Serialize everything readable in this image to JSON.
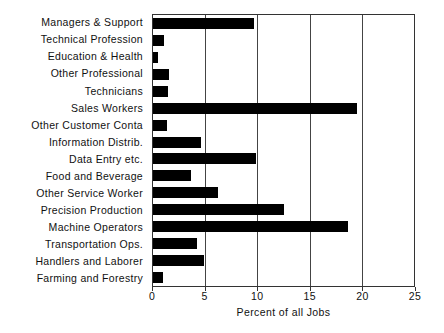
{
  "chart_data": {
    "type": "bar",
    "orientation": "horizontal",
    "title": "",
    "xlabel": "Percent of all Jobs",
    "ylabel": "",
    "xlim": [
      0,
      25
    ],
    "xticks": [
      0,
      5,
      10,
      15,
      20,
      25
    ],
    "grid": true,
    "legend": null,
    "bar_color": "#000000",
    "frame_color": "#333333",
    "categories": [
      "Managers & Support",
      "Technical Profession",
      "Education & Health",
      "Other Professional",
      "Technicians",
      "Sales Workers",
      "Other Customer Conta",
      "Information Distrib.",
      "Data Entry etc.",
      "Food and Beverage",
      "Other Service Worker",
      "Precision Production",
      "Machine Operators",
      "Transportation Ops.",
      "Handlers and Laborer",
      "Farming and Forestry"
    ],
    "values": [
      9.7,
      1.1,
      0.5,
      1.5,
      1.4,
      19.5,
      1.3,
      4.6,
      9.9,
      3.6,
      6.2,
      12.5,
      18.7,
      4.2,
      4.9,
      1.0
    ]
  }
}
